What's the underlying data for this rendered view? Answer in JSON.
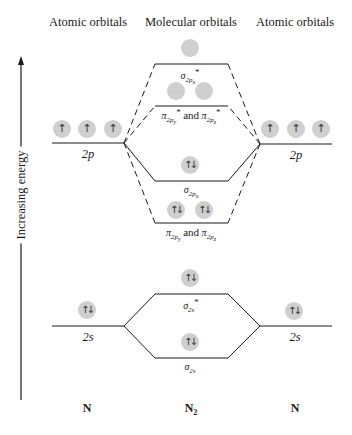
{
  "headers": {
    "left": "Atomic orbitals",
    "center": "Molecular orbitals",
    "right": "Atomic orbitals"
  },
  "axis": {
    "label": "Increasing energy",
    "direction": "up"
  },
  "atomic_levels": {
    "left_2p": {
      "label": "2p",
      "electrons": [
        "↑",
        "↑",
        "↑"
      ]
    },
    "right_2p": {
      "label": "2p",
      "electrons": [
        "↑",
        "↑",
        "↑"
      ]
    },
    "left_2s": {
      "label": "2s",
      "electrons": [
        "↑↓"
      ]
    },
    "right_2s": {
      "label": "2s",
      "electrons": [
        "↑↓"
      ]
    }
  },
  "molecular_orbitals": {
    "sigma_2px_star": {
      "symbol": "σ",
      "sub": "2p",
      "subsub": "x",
      "star": "*",
      "electrons": [
        ""
      ]
    },
    "pi_2p_star": {
      "symbol_a": "π",
      "sub_a": "2p",
      "subsub_a": "y",
      "and": "and",
      "symbol_b": "π",
      "sub_b": "2p",
      "subsub_b": "z",
      "star": "*",
      "electrons": [
        "",
        ""
      ]
    },
    "sigma_2px": {
      "symbol": "σ",
      "sub": "2p",
      "subsub": "x",
      "electrons": [
        "↑↓"
      ]
    },
    "pi_2p": {
      "symbol_a": "π",
      "sub_a": "2p",
      "subsub_a": "y",
      "and": "and",
      "symbol_b": "π",
      "sub_b": "2p",
      "subsub_b": "z",
      "electrons": [
        "↑↓",
        "↑↓"
      ]
    },
    "sigma_2s_star": {
      "symbol": "σ",
      "sub": "2s",
      "star": "*",
      "electrons": [
        "↑↓"
      ]
    },
    "sigma_2s": {
      "symbol": "σ",
      "sub": "2s",
      "electrons": [
        "↑↓"
      ]
    }
  },
  "species": {
    "left": "N",
    "center_base": "N",
    "center_sub": "2",
    "right": "N"
  },
  "colors": {
    "line": "#1a1a1a",
    "orbital_fill": "#cfcfcf",
    "text": "#1a1a1a"
  }
}
